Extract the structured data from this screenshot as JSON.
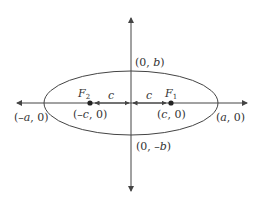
{
  "diagram": {
    "colors": {
      "stroke": "#444444",
      "text": "#333333",
      "background": "#ffffff"
    },
    "labels": {
      "top_vertex": {
        "open": "(0, ",
        "var": "b",
        "close": ")"
      },
      "bottom_vertex": {
        "open": "(0, –",
        "var": "b",
        "close": ")"
      },
      "left_vertex": {
        "open": "(–",
        "var": "a",
        "close": ", 0)"
      },
      "right_vertex": {
        "open": "(",
        "var": "a",
        "close": ", 0)"
      },
      "left_focus_coord": {
        "open": "(–",
        "var": "c",
        "close": ", 0)"
      },
      "right_focus_coord": {
        "open": "(",
        "var": "c",
        "close": ", 0)"
      },
      "focus_2": {
        "letter": "F",
        "sub": "2"
      },
      "focus_1": {
        "letter": "F",
        "sub": "1"
      },
      "dist_left": "c",
      "dist_right": "c"
    }
  }
}
